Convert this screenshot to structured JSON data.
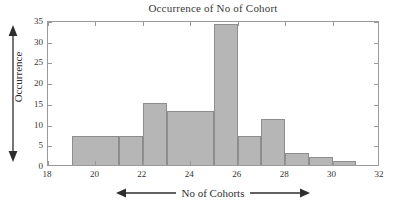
{
  "chart_data": {
    "type": "bar",
    "title": "Occurrence of No of Cohort",
    "xlabel": "No of Cohorts",
    "ylabel": "Occurrence",
    "categories": [
      "19",
      "20",
      "21",
      "22",
      "23",
      "24",
      "25",
      "26",
      "27",
      "28",
      "29",
      "30"
    ],
    "bin_edges": [
      19,
      20,
      21,
      22,
      23,
      24,
      25,
      26,
      27,
      28,
      29,
      30,
      31
    ],
    "values": [
      7,
      7,
      0,
      15,
      13,
      34,
      7,
      11,
      3,
      2,
      1,
      0
    ],
    "bars": [
      {
        "x0": 19,
        "x1": 21,
        "value": 7
      },
      {
        "x0": 21,
        "x1": 22,
        "value": 7
      },
      {
        "x0": 22,
        "x1": 23,
        "value": 15
      },
      {
        "x0": 23,
        "x1": 25,
        "value": 13
      },
      {
        "x0": 25,
        "x1": 26,
        "value": 34
      },
      {
        "x0": 26,
        "x1": 27,
        "value": 7
      },
      {
        "x0": 27,
        "x1": 28,
        "value": 11
      },
      {
        "x0": 28,
        "x1": 29,
        "value": 3
      },
      {
        "x0": 29,
        "x1": 30,
        "value": 2
      },
      {
        "x0": 30,
        "x1": 31,
        "value": 1
      }
    ],
    "xlim": [
      18,
      32
    ],
    "ylim": [
      0,
      35
    ],
    "xticks": [
      18,
      20,
      22,
      24,
      26,
      28,
      30,
      32
    ],
    "yticks": [
      0,
      5,
      10,
      15,
      20,
      25,
      30,
      35
    ],
    "grid": false,
    "legend": null,
    "bar_color": "#b6b6b6",
    "bar_edge_color": "#8d8d8d",
    "axis_color": "#9a9a9a",
    "text_color": "#2e2e2e",
    "xlabel_arrows": "double-headed-horizontal",
    "ylabel_arrows": "double-headed-vertical"
  }
}
